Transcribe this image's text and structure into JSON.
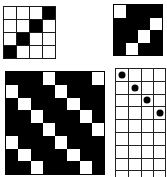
{
  "figures": [
    {
      "id": "top-left",
      "name": "4x4 anti-diagonal pattern",
      "rows": 4,
      "cols": 4,
      "style": "black-on-white",
      "filled_cells": [
        [
          0,
          3
        ],
        [
          1,
          2
        ],
        [
          2,
          1
        ],
        [
          3,
          0
        ]
      ]
    },
    {
      "id": "top-right",
      "name": "4x4 inverted pattern",
      "rows": 4,
      "cols": 4,
      "style": "white-on-black",
      "white_cells": [
        [
          0,
          0
        ],
        [
          1,
          3
        ],
        [
          2,
          2
        ],
        [
          3,
          1
        ]
      ]
    },
    {
      "id": "bottom-left",
      "name": "8x8 inverted diagonal pattern",
      "rows": 8,
      "cols": 8,
      "style": "white-on-black",
      "white_cells": [
        [
          0,
          3
        ],
        [
          0,
          7
        ],
        [
          1,
          0
        ],
        [
          1,
          4
        ],
        [
          2,
          1
        ],
        [
          2,
          5
        ],
        [
          3,
          2
        ],
        [
          3,
          6
        ],
        [
          4,
          3
        ],
        [
          4,
          7
        ],
        [
          5,
          0
        ],
        [
          5,
          4
        ],
        [
          6,
          1
        ],
        [
          6,
          5
        ],
        [
          7,
          2
        ],
        [
          7,
          6
        ]
      ]
    },
    {
      "id": "bottom-right",
      "name": "open grid with dots",
      "rows": 8,
      "cols": 4,
      "style": "dots",
      "dot_cells": [
        [
          0,
          0
        ],
        [
          1,
          1
        ],
        [
          2,
          2
        ],
        [
          3,
          3
        ]
      ]
    }
  ],
  "colors": {
    "fill": "#000000",
    "background": "#ffffff",
    "line": "#1a1a1a"
  }
}
